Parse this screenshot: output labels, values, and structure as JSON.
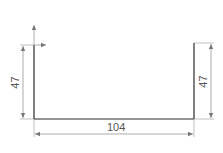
{
  "drawing": {
    "type": "sheet-metal channel sketch (U-profile)",
    "colors": {
      "profile": "#2a2a2a",
      "dimension": "#7a7a7a",
      "text": "#555555",
      "background": "#ffffff"
    },
    "dimensions": {
      "left_height": "47",
      "right_height": "47",
      "bottom_width": "104"
    },
    "axes": {
      "origin_x_arrow": "x-axis-arrow",
      "origin_y_arrow": "y-axis-arrow"
    }
  }
}
